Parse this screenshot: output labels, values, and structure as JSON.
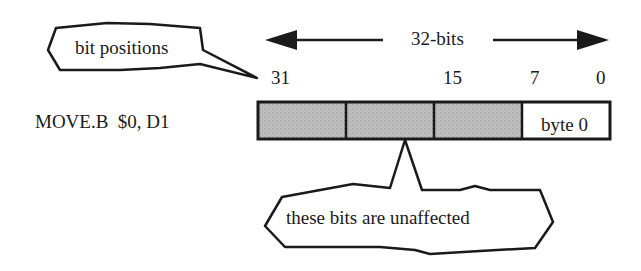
{
  "instruction": "MOVE.B  $0, D1",
  "width_label": "32-bits",
  "bit_positions": [
    "31",
    "15",
    "7",
    "0"
  ],
  "register": {
    "cells": [
      {
        "label": "",
        "shaded": true
      },
      {
        "label": "",
        "shaded": true
      },
      {
        "label": "",
        "shaded": true
      },
      {
        "label": "byte 0",
        "shaded": false
      }
    ]
  },
  "callouts": {
    "bit_positions": "bit positions",
    "unaffected": "these bits are unaffected"
  },
  "colors": {
    "shaded_fill": "#b8b8b8",
    "stroke": "#1a1a1a"
  }
}
